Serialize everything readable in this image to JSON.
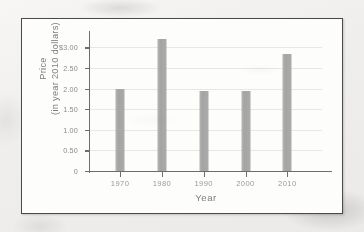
{
  "chart_data": {
    "type": "bar",
    "title": "",
    "xlabel": "Year",
    "ylabel": "Price\n(in year 2010 dollars)",
    "ylabel_line1": "Price",
    "ylabel_line2": "(in year 2010 dollars)",
    "categories": [
      "1970",
      "1980",
      "1990",
      "2000",
      "2010"
    ],
    "values": [
      2.0,
      3.2,
      1.93,
      1.95,
      2.85
    ],
    "ylim": [
      0,
      3.35
    ],
    "ytick_values": [
      0,
      0.5,
      1.0,
      1.5,
      2.0,
      2.5,
      3.0
    ],
    "ytick_labels": [
      "0",
      "0.50",
      "1.00",
      "1.50",
      "2.00",
      "2.50",
      "$3.00"
    ],
    "grid": true,
    "legend": null,
    "bar_color": "#a8a8a8",
    "axis_color": "#6d6d6d",
    "grid_color": "#e8e7e5"
  },
  "figure": {
    "border_color": "#4a4a4a",
    "background": "#fdfdfc"
  }
}
